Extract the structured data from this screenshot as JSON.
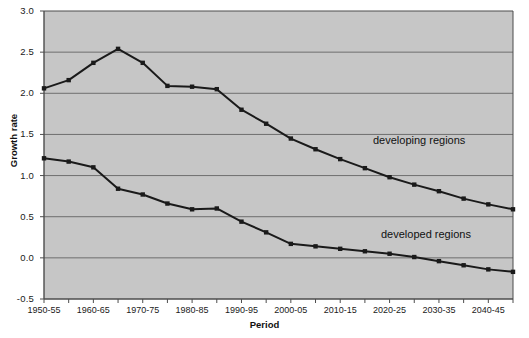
{
  "chart_data": {
    "type": "line",
    "title": "",
    "xlabel": "Period",
    "ylabel": "Growth rate",
    "ylim": [
      -0.5,
      3.0
    ],
    "yticks": [
      "3.0",
      "2.5",
      "2.0",
      "1.5",
      "1.0",
      "0.5",
      "0.0",
      "-0.5"
    ],
    "ytick_values": [
      3.0,
      2.5,
      2.0,
      1.5,
      1.0,
      0.5,
      0.0,
      -0.5
    ],
    "grid": true,
    "legend_position": "inline-annotations",
    "categories": [
      "1950-55",
      "1955-60",
      "1960-65",
      "1965-70",
      "1970-75",
      "1975-80",
      "1980-85",
      "1985-90",
      "1990-95",
      "1995-00",
      "2000-05",
      "2005-10",
      "2010-15",
      "2015-20",
      "2020-25",
      "2025-30",
      "2030-35",
      "2035-40",
      "2040-45",
      "2045-50"
    ],
    "xtick_labels": [
      "1950-55",
      "1960-65",
      "1970-75",
      "1980-85",
      "1990-95",
      "2000-05",
      "2010-15",
      "2020-25",
      "2030-35",
      "2040-45"
    ],
    "xtick_label_indices": [
      0,
      2,
      4,
      6,
      8,
      10,
      12,
      14,
      16,
      18
    ],
    "series": [
      {
        "name": "developing regions",
        "color": "#1a1a1a",
        "values": [
          2.06,
          2.16,
          2.37,
          2.54,
          2.37,
          2.09,
          2.08,
          2.05,
          1.8,
          1.63,
          1.45,
          1.32,
          1.2,
          1.09,
          0.98,
          0.89,
          0.81,
          0.72,
          0.65,
          0.59
        ]
      },
      {
        "name": "developed regions",
        "color": "#1a1a1a",
        "values": [
          1.21,
          1.17,
          1.1,
          0.84,
          0.77,
          0.66,
          0.59,
          0.6,
          0.44,
          0.31,
          0.17,
          0.14,
          0.11,
          0.08,
          0.05,
          0.01,
          -0.04,
          -0.09,
          -0.14,
          -0.17
        ]
      }
    ],
    "annotations": [
      {
        "text": "developing regions",
        "x_index": 15,
        "y": 1.32
      },
      {
        "text": "developed regions",
        "x_index": 15,
        "y": 0.18
      }
    ]
  },
  "style": {
    "plot_background": "#c6c6c6",
    "grid_color": "#6e6e6e",
    "axis_color": "#4d4d4d",
    "line_color": "#1a1a1a",
    "page_background": "#ffffff"
  }
}
